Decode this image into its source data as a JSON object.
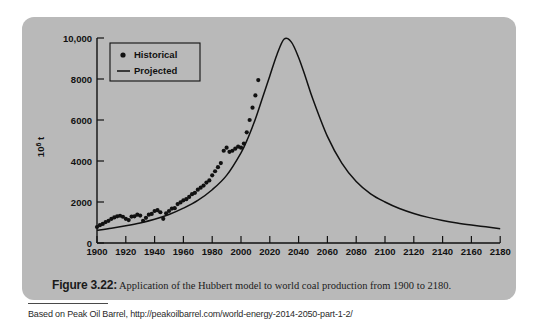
{
  "figure": {
    "caption_label": "Figure 3.22:",
    "caption_text": " Application of the Hubbert model to world coal production from 1900 to 2180.",
    "source": "Based on Peak Oil Barrel, http://peakoilbarrel.com/world-energy-2014-2050-part-1-2/",
    "card_color": "#b9b9b9",
    "ink_color": "#111111"
  },
  "chart_data": {
    "type": "line",
    "title": "",
    "xlabel": "",
    "ylabel": "10⁶ t",
    "ylabel_base": "10",
    "ylabel_exp": "6",
    "ylabel_unit": " t",
    "xlim": [
      1900,
      2180
    ],
    "ylim": [
      0,
      10000
    ],
    "grid": false,
    "legend_position": "top-left",
    "xticks": [
      1900,
      1920,
      1940,
      1960,
      1980,
      2000,
      2020,
      2040,
      2060,
      2080,
      2100,
      2120,
      2140,
      2160,
      2180
    ],
    "xticklabels": [
      "1900",
      "1920",
      "1940",
      "1960",
      "1980",
      "2000",
      "2020",
      "2040",
      "2060",
      "2080",
      "2100",
      "2120",
      "2140",
      "2160",
      "2180"
    ],
    "yticks": [
      0,
      2000,
      4000,
      6000,
      8000,
      10000
    ],
    "yticklabels": [
      "0",
      "2000",
      "4000",
      "6000",
      "8000",
      "10,000"
    ],
    "series": [
      {
        "name": "Historical",
        "label": "Historical",
        "marker": "dot",
        "type": "scatter",
        "x": [
          1900,
          1902,
          1904,
          1906,
          1908,
          1910,
          1912,
          1914,
          1916,
          1918,
          1920,
          1922,
          1924,
          1926,
          1928,
          1930,
          1932,
          1934,
          1936,
          1938,
          1940,
          1942,
          1944,
          1946,
          1948,
          1950,
          1952,
          1954,
          1956,
          1958,
          1960,
          1962,
          1964,
          1966,
          1968,
          1970,
          1972,
          1974,
          1976,
          1978,
          1980,
          1982,
          1984,
          1986,
          1988,
          1990,
          1992,
          1994,
          1996,
          1998,
          2000,
          2002,
          2004,
          2006,
          2008,
          2010,
          2012
        ],
        "y": [
          780,
          870,
          930,
          1020,
          1080,
          1180,
          1250,
          1300,
          1330,
          1280,
          1180,
          1120,
          1290,
          1300,
          1380,
          1340,
          1080,
          1230,
          1380,
          1420,
          1560,
          1600,
          1500,
          1180,
          1450,
          1560,
          1680,
          1700,
          1900,
          1980,
          2080,
          2140,
          2250,
          2380,
          2450,
          2600,
          2700,
          2800,
          2950,
          3050,
          3300,
          3500,
          3700,
          3900,
          4500,
          4650,
          4450,
          4500,
          4600,
          4700,
          4650,
          4850,
          5400,
          6000,
          6600,
          7200,
          7950
        ]
      },
      {
        "name": "Projected",
        "label": "Projected",
        "marker": "line",
        "type": "line",
        "peak_year": 2030,
        "peak_value": 9950,
        "x": [
          1900,
          1910,
          1920,
          1930,
          1940,
          1950,
          1960,
          1970,
          1980,
          1990,
          2000,
          2005,
          2010,
          2015,
          2020,
          2025,
          2030,
          2035,
          2040,
          2045,
          2050,
          2060,
          2070,
          2080,
          2090,
          2100,
          2110,
          2120,
          2130,
          2140,
          2150,
          2160,
          2170,
          2180
        ],
        "y": [
          620,
          720,
          840,
          980,
          1160,
          1390,
          1700,
          2080,
          2600,
          3300,
          4400,
          5150,
          6050,
          7100,
          8150,
          9200,
          9950,
          9800,
          9050,
          8050,
          7000,
          5200,
          3900,
          3000,
          2400,
          2000,
          1680,
          1440,
          1250,
          1100,
          980,
          880,
          790,
          700
        ]
      }
    ]
  }
}
